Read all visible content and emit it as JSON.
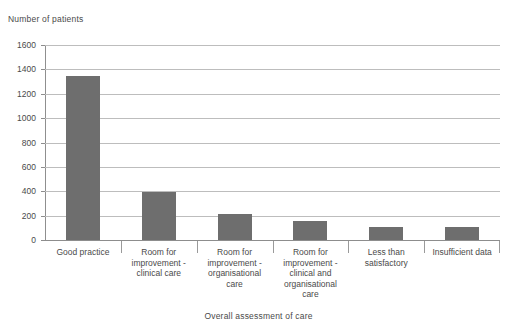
{
  "chart_data": {
    "type": "bar",
    "title": "",
    "xlabel": "Overall assessment of care",
    "ylabel": "Number of patients",
    "categories": [
      "Good practice",
      "Room for\nimprovement -\nclinical care",
      "Room for\nimprovement -\norganisational\ncare",
      "Room for\nimprovement -\nclinical and\norganisational\ncare",
      "Less than\nsatisfactory",
      "Insufficient data"
    ],
    "values": [
      1345,
      395,
      210,
      160,
      105,
      110
    ],
    "ylim": [
      0,
      1600
    ],
    "ytick_step": 200,
    "ytick_labels": [
      "0",
      "200",
      "400",
      "600",
      "800",
      "1000",
      "1200",
      "1400",
      "1600"
    ],
    "grid": true,
    "legend": "none",
    "bar_color": "#6e6e6e",
    "gridline_color": "#bdbdbd",
    "axis_color": "#8d8d8d"
  },
  "axes": {
    "y_title": "Number of patients",
    "x_title": "Overall assessment of care"
  }
}
